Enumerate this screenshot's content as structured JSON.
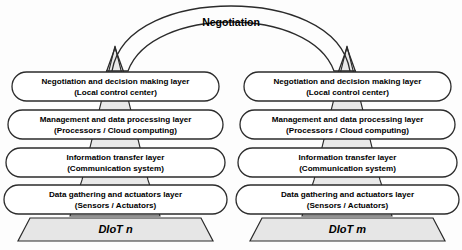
{
  "diagram": {
    "negotiation_label": "Negotiation",
    "colors": {
      "pyramid_fill": "#e9e9e9",
      "base_fill": "#e6e6e6",
      "box_fill": "#ffffff",
      "stroke": "#2b2b2b",
      "background": "#fdfdfd"
    },
    "stacks": [
      {
        "id": "left",
        "base_label": "DIoT n",
        "layers": [
          {
            "title": "Negotiation and decision making layer",
            "subtitle": "(Local control center)"
          },
          {
            "title": "Management and data processing layer",
            "subtitle": "(Processors /  Cloud computing)"
          },
          {
            "title": "Information transfer layer",
            "subtitle": "(Communication system)"
          },
          {
            "title": "Data gathering and actuators layer",
            "subtitle": "(Sensors / Actuators)"
          }
        ]
      },
      {
        "id": "right",
        "base_label": "DIoT m",
        "layers": [
          {
            "title": "Negotiation and decision making layer",
            "subtitle": "(Local control center)"
          },
          {
            "title": "Management and data processing layer",
            "subtitle": "(Processors /  Cloud computing)"
          },
          {
            "title": "Information transfer layer",
            "subtitle": "(Communication system)"
          },
          {
            "title": "Data gathering and actuators layer",
            "subtitle": "(Sensors / Actuators)"
          }
        ]
      }
    ]
  }
}
